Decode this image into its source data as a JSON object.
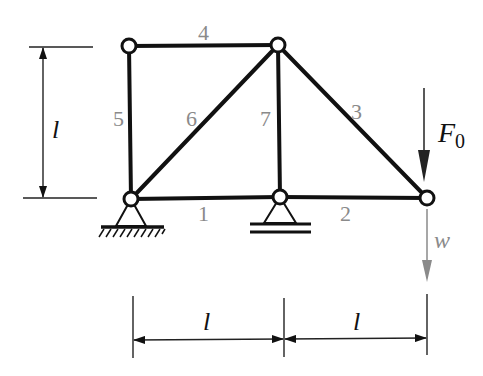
{
  "diagram": {
    "type": "plane truss",
    "members": [
      {
        "id": "1",
        "label": "1",
        "from": "A",
        "to": "B"
      },
      {
        "id": "2",
        "label": "2",
        "from": "B",
        "to": "C"
      },
      {
        "id": "3",
        "label": "3",
        "from": "E",
        "to": "C"
      },
      {
        "id": "4",
        "label": "4",
        "from": "D",
        "to": "E"
      },
      {
        "id": "5",
        "label": "5",
        "from": "A",
        "to": "D"
      },
      {
        "id": "6",
        "label": "6",
        "from": "A",
        "to": "E"
      },
      {
        "id": "7",
        "label": "7",
        "from": "B",
        "to": "E"
      }
    ],
    "supports": {
      "pin": "fixed pin support at bottom-left node",
      "roller": "roller support at bottom-middle node"
    },
    "load": {
      "symbol": "F",
      "subscript": "0",
      "direction": "down"
    },
    "displacement": {
      "symbol": "w",
      "direction": "down"
    },
    "dimensions": {
      "height_label": "l",
      "span_left_label": "l",
      "span_right_label": "l"
    },
    "colors": {
      "members": "#111111",
      "member_labels": "#8a8a8a",
      "displacement_arrow": "#8a8a8a"
    }
  }
}
